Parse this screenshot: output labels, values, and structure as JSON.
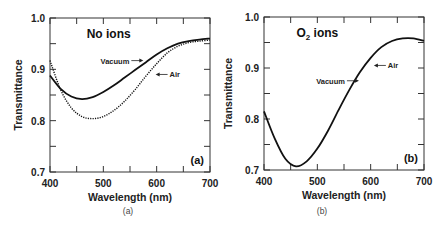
{
  "chart_data": [
    {
      "type": "line",
      "panel": "(a)",
      "title": "No ions",
      "caption": "(a)",
      "xlabel": "Wavelength (nm)",
      "ylabel": "Transmittance",
      "xlim": [
        400,
        700
      ],
      "ylim": [
        0.7,
        1.0
      ],
      "xticks": [
        400,
        500,
        600,
        700
      ],
      "yticks": [
        0.7,
        0.8,
        0.9,
        1.0
      ],
      "ytick_labels": [
        "0.7",
        "0.8",
        "0.9",
        "1.0"
      ],
      "grid": false,
      "annotations": [
        {
          "text": "Vacuum",
          "arrow": "right",
          "x": 575,
          "y": 0.917
        },
        {
          "text": "Air",
          "arrow": "left",
          "x": 598,
          "y": 0.89
        }
      ],
      "series": [
        {
          "name": "Vacuum",
          "style": "solid",
          "x": [
            400,
            420,
            440,
            460,
            480,
            500,
            520,
            540,
            560,
            580,
            600,
            620,
            640,
            660,
            680,
            700
          ],
          "y": [
            0.888,
            0.862,
            0.847,
            0.842,
            0.846,
            0.856,
            0.869,
            0.884,
            0.899,
            0.914,
            0.929,
            0.941,
            0.95,
            0.955,
            0.958,
            0.96
          ]
        },
        {
          "name": "Air",
          "style": "dotted",
          "x": [
            400,
            420,
            440,
            460,
            480,
            500,
            520,
            540,
            560,
            580,
            600,
            620,
            640,
            660,
            680,
            700
          ],
          "y": [
            0.917,
            0.86,
            0.825,
            0.808,
            0.804,
            0.808,
            0.82,
            0.838,
            0.861,
            0.887,
            0.911,
            0.932,
            0.945,
            0.952,
            0.955,
            0.957
          ]
        }
      ]
    },
    {
      "type": "line",
      "panel": "(b)",
      "title": "O2 ions",
      "title_main": "O",
      "title_sub": "2",
      "title_rest": " ions",
      "caption": "(b)",
      "xlabel": "Wavelength (nm)",
      "ylabel": "Transmittance",
      "xlim": [
        400,
        700
      ],
      "ylim": [
        0.7,
        1.0
      ],
      "xticks": [
        400,
        500,
        600,
        700
      ],
      "yticks": [
        0.7,
        0.8,
        0.9,
        1.0
      ],
      "ytick_labels": [
        "0.7",
        "0.8",
        "0.9",
        "1.0"
      ],
      "grid": false,
      "annotations": [
        {
          "text": "Vacuum",
          "arrow": "right",
          "x": 578,
          "y": 0.875
        },
        {
          "text": "Air",
          "arrow": "left",
          "x": 606,
          "y": 0.905
        }
      ],
      "series": [
        {
          "name": "Vacuum / Air (coincident)",
          "style": "solid",
          "x": [
            400,
            420,
            440,
            460,
            480,
            500,
            520,
            540,
            560,
            580,
            600,
            620,
            640,
            660,
            680,
            700
          ],
          "y": [
            0.815,
            0.762,
            0.722,
            0.707,
            0.717,
            0.742,
            0.777,
            0.818,
            0.857,
            0.892,
            0.92,
            0.941,
            0.953,
            0.958,
            0.958,
            0.953
          ]
        }
      ]
    }
  ]
}
